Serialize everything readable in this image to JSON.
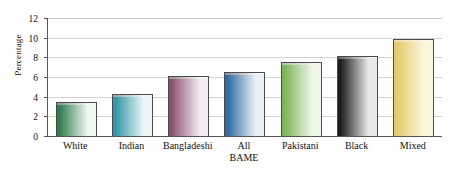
{
  "chart_data": {
    "type": "bar",
    "title": "",
    "subtitle": "",
    "xlabel": "",
    "ylabel": "Percentage",
    "ylim": [
      0,
      12
    ],
    "yticks": [
      0,
      2,
      4,
      6,
      8,
      10,
      12
    ],
    "grid": true,
    "legend": false,
    "categories": [
      "White",
      "Indian",
      "Bangladeshi",
      "All BAME",
      "Pakistani",
      "Black",
      "Mixed"
    ],
    "category_lines": [
      [
        "White"
      ],
      [
        "Indian"
      ],
      [
        "Bangladeshi"
      ],
      [
        "All",
        "BAME"
      ],
      [
        "Pakistani"
      ],
      [
        "Black"
      ],
      [
        "Mixed"
      ]
    ],
    "values": [
      3.5,
      4.3,
      6.1,
      6.5,
      7.5,
      8.1,
      9.9
    ],
    "bar_colors": [
      {
        "dark": "#2f7d4f",
        "light": "#eef7f0"
      },
      {
        "dark": "#2e96a8",
        "light": "#eaf6f8"
      },
      {
        "dark": "#8c4f74",
        "light": "#f2eaf0"
      },
      {
        "dark": "#2f6ba3",
        "light": "#e9f0f7"
      },
      {
        "dark": "#7fb45a",
        "light": "#eff7e7"
      },
      {
        "dark": "#1c1c1c",
        "light": "#e8e8e8"
      },
      {
        "dark": "#e4c96a",
        "light": "#fbf6de"
      }
    ],
    "bar_outline": "#4a4a4a",
    "axis_color": "#555555",
    "grid_color": "#d2d2d2",
    "background": "#ffffff"
  }
}
